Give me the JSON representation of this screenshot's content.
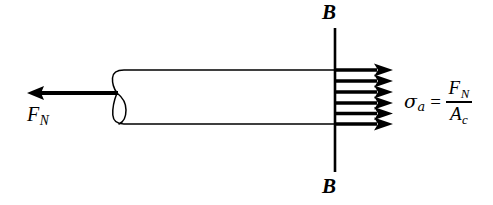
{
  "figure": {
    "background_color": "#ffffff",
    "stroke_color": "#000000",
    "width": 493,
    "height": 205
  },
  "labels": {
    "section_top": "B",
    "section_bottom": "B",
    "applied_force": {
      "symbol": "F",
      "subscript": "N"
    }
  },
  "formula": {
    "stress_symbol": "σ",
    "stress_subscript": "a",
    "equals": "=",
    "numerator": {
      "symbol": "F",
      "subscript": "N"
    },
    "denominator": {
      "symbol": "A",
      "subscript": "c"
    },
    "plain_text": "σa = FN / Ac"
  },
  "geometry": {
    "bar": {
      "top_edge_y": 70,
      "bottom_edge_y": 124,
      "left_cap_x": 112,
      "right_end_x": 336
    },
    "section_line": {
      "x": 335,
      "y_top": 28,
      "y_bottom": 172
    },
    "stress_arrows": {
      "count": 6,
      "direction": "right",
      "start_x": 336,
      "tip_x": 393,
      "y_positions": [
        70,
        81,
        92,
        103,
        113,
        124
      ]
    },
    "load_arrow": {
      "direction": "left",
      "tip_x": 27,
      "tail_x": 118,
      "y": 93
    }
  }
}
